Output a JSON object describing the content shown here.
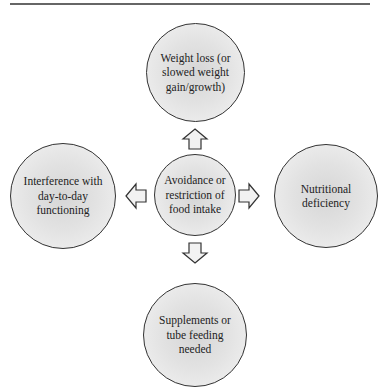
{
  "diagram": {
    "type": "hub-and-spoke",
    "center": {
      "id": "center",
      "label": "Avoidance or restriction of food intake"
    },
    "nodes": [
      {
        "id": "top",
        "label": "Weight loss (or slowed weight gain/growth)",
        "position": "top"
      },
      {
        "id": "left",
        "label": "Interference with day-to-day functioning",
        "position": "left"
      },
      {
        "id": "right",
        "label": "Nutritional deficiency",
        "position": "right"
      },
      {
        "id": "bottom",
        "label": "Supplements or tube feeding needed",
        "position": "bottom"
      }
    ],
    "edges": [
      {
        "from": "center",
        "to": "top",
        "style": "block-arrow"
      },
      {
        "from": "center",
        "to": "left",
        "style": "block-arrow"
      },
      {
        "from": "center",
        "to": "right",
        "style": "block-arrow"
      },
      {
        "from": "center",
        "to": "bottom",
        "style": "block-arrow"
      }
    ],
    "colors": {
      "stroke": "#333333",
      "fill_center": "#d6d6d6",
      "fill_edge": "#f4f4f4",
      "rule": "#666666"
    }
  }
}
